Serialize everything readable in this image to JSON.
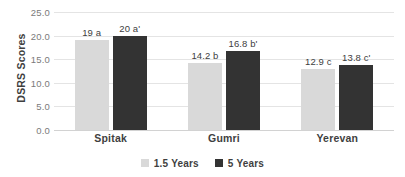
{
  "chart_data": {
    "type": "bar",
    "title": "",
    "subtitle": "",
    "xlabel": "",
    "ylabel": "DSRS Scores",
    "categories": [
      "Spitak",
      "Gumri",
      "Yerevan"
    ],
    "series": [
      {
        "name": "1.5 Years",
        "color": "#d9d9d9",
        "values": [
          19,
          14.2,
          12.9
        ],
        "labels": [
          "19 a",
          "14.2 b",
          "12.9 c"
        ]
      },
      {
        "name": "5 Years",
        "color": "#333333",
        "values": [
          20,
          16.8,
          13.8
        ],
        "labels": [
          "20 a'",
          "16.8 b'",
          "13.8 c'"
        ]
      }
    ],
    "ylim": [
      0,
      25
    ],
    "ytick_step": 5,
    "ytick_labels": [
      "0.0",
      "5.0",
      "10.0",
      "15.0",
      "20.0",
      "25.0"
    ],
    "ytick_values": [
      0,
      5,
      10,
      15,
      20,
      25
    ],
    "grid": "horizontal",
    "legend_position": "bottom",
    "annotations": [
      "19 a",
      "20 a'",
      "14.2 b",
      "16.8 b'",
      "12.9 c",
      "13.8 c'"
    ]
  },
  "axis": {
    "y_title": "DSRS Scores"
  },
  "legend": {
    "items": [
      {
        "label": "1.5 Years",
        "color": "#d9d9d9"
      },
      {
        "label": "5 Years",
        "color": "#333333"
      }
    ]
  },
  "colors": {
    "series_1": "#d9d9d9",
    "series_2": "#333333",
    "gridline": "#e4e4e4",
    "axis_text": "#7a7a7a",
    "label_text": "#3f3f3f",
    "background": "#ffffff"
  }
}
